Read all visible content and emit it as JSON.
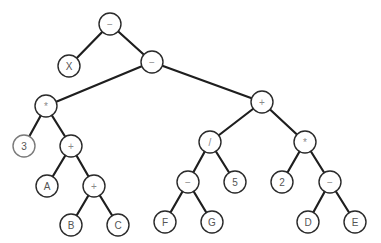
{
  "diagram": {
    "type": "expression-tree",
    "node_radius": 11,
    "colors": {
      "edge": "#1e1e1e",
      "node_border": "#2a2a2a",
      "node_fill": "#ffffff",
      "label": "#555555",
      "operator_label": "#8a8a8a"
    },
    "nodes": [
      {
        "id": "n0",
        "label": "−",
        "kind": "op",
        "x": 110,
        "y": 24
      },
      {
        "id": "n1",
        "label": "X",
        "kind": "operand",
        "x": 69,
        "y": 66
      },
      {
        "id": "n2",
        "label": "−",
        "kind": "op",
        "x": 152,
        "y": 62
      },
      {
        "id": "n3",
        "label": "*",
        "kind": "op",
        "x": 46,
        "y": 106
      },
      {
        "id": "n4",
        "label": "+",
        "kind": "op",
        "x": 262,
        "y": 102
      },
      {
        "id": "n5",
        "label": "3",
        "kind": "operand",
        "x": 24,
        "y": 146,
        "faint": true
      },
      {
        "id": "n6",
        "label": "+",
        "kind": "op",
        "x": 71,
        "y": 146
      },
      {
        "id": "n7",
        "label": "/",
        "kind": "op",
        "x": 210,
        "y": 142
      },
      {
        "id": "n8",
        "label": "*",
        "kind": "op",
        "x": 305,
        "y": 142
      },
      {
        "id": "n9",
        "label": "A",
        "kind": "operand",
        "x": 47,
        "y": 186
      },
      {
        "id": "n10",
        "label": "+",
        "kind": "op",
        "x": 94,
        "y": 186
      },
      {
        "id": "n11",
        "label": "−",
        "kind": "op",
        "x": 188,
        "y": 182
      },
      {
        "id": "n12",
        "label": "5",
        "kind": "operand",
        "x": 235,
        "y": 182
      },
      {
        "id": "n13",
        "label": "2",
        "kind": "operand",
        "x": 282,
        "y": 182
      },
      {
        "id": "n14",
        "label": "−",
        "kind": "op",
        "x": 330,
        "y": 182
      },
      {
        "id": "n15",
        "label": "B",
        "kind": "operand",
        "x": 71,
        "y": 225
      },
      {
        "id": "n16",
        "label": "C",
        "kind": "operand",
        "x": 118,
        "y": 225
      },
      {
        "id": "n17",
        "label": "F",
        "kind": "operand",
        "x": 165,
        "y": 222
      },
      {
        "id": "n18",
        "label": "G",
        "kind": "operand",
        "x": 212,
        "y": 222
      },
      {
        "id": "n19",
        "label": "D",
        "kind": "operand",
        "x": 308,
        "y": 222
      },
      {
        "id": "n20",
        "label": "E",
        "kind": "operand",
        "x": 355,
        "y": 222
      }
    ],
    "edges": [
      [
        "n0",
        "n1"
      ],
      [
        "n0",
        "n2"
      ],
      [
        "n2",
        "n3"
      ],
      [
        "n2",
        "n4"
      ],
      [
        "n3",
        "n5"
      ],
      [
        "n3",
        "n6"
      ],
      [
        "n6",
        "n9"
      ],
      [
        "n6",
        "n10"
      ],
      [
        "n10",
        "n15"
      ],
      [
        "n10",
        "n16"
      ],
      [
        "n4",
        "n7"
      ],
      [
        "n4",
        "n8"
      ],
      [
        "n7",
        "n11"
      ],
      [
        "n7",
        "n12"
      ],
      [
        "n11",
        "n17"
      ],
      [
        "n11",
        "n18"
      ],
      [
        "n8",
        "n13"
      ],
      [
        "n8",
        "n14"
      ],
      [
        "n14",
        "n19"
      ],
      [
        "n14",
        "n20"
      ]
    ]
  }
}
